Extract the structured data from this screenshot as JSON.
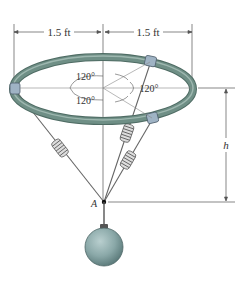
{
  "figure": {
    "dimensions": {
      "left_span": "1.5 ft",
      "right_span": "1.5 ft",
      "height_label": "h"
    },
    "angles": [
      "120°",
      "120°",
      "120°"
    ],
    "point_label": "A",
    "components": {
      "ring": "horizontal circular ring with three collars",
      "springs": 3,
      "weight": "spherical ball hanging from point A"
    },
    "colors": {
      "ring": "#6f8f86",
      "ring_highlight": "#a9c0b9",
      "collar": "#9fb3c4",
      "ball": "#8aa8a8",
      "lines": "#555555"
    }
  }
}
